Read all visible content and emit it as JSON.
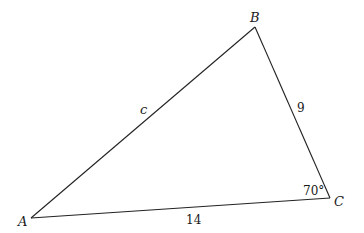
{
  "figure": {
    "type": "triangle",
    "vertices": {
      "A": {
        "label": "A"
      },
      "B": {
        "label": "B"
      },
      "C": {
        "label": "C"
      }
    },
    "sides": {
      "AB": {
        "label": "c"
      },
      "BC": {
        "label": "9"
      },
      "AC": {
        "label": "14"
      }
    },
    "angles": {
      "C": {
        "label": "70°"
      }
    },
    "line_color": "#222222"
  }
}
